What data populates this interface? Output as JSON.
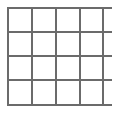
{
  "canvas": {
    "width": 116,
    "height": 113,
    "background_color": "#ffffff"
  },
  "figure": {
    "kind": "grid-table-outline",
    "rows": 4,
    "columns": 4,
    "cells_total": 16,
    "cell_text": "",
    "line_color": "#6b6b6b",
    "line_width": 1.5,
    "fill_color": "#ffffff"
  },
  "grid_geometry": {
    "vertical_line_x": [
      8,
      32,
      56,
      80,
      103
    ],
    "horizontal_line_y": [
      8,
      32,
      56,
      80,
      105
    ],
    "vertical_line_top": 8,
    "vertical_line_bottom": 105,
    "horizontal_line_left": 7,
    "horizontal_line_right": 112
  }
}
